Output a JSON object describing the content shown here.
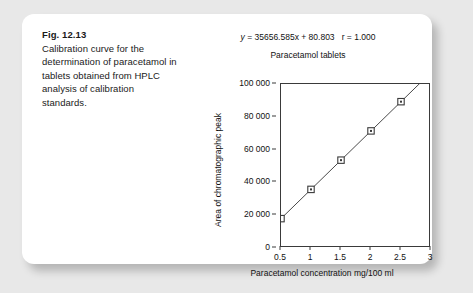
{
  "card": {
    "background_color": "#ffffff",
    "page_background_color": "#e8e8e8"
  },
  "caption": {
    "figure_number": "Fig. 12.13",
    "text": "Calibration curve for the determination of paracetamol in tablets obtained from HPLC analysis of calibration standards."
  },
  "figure": {
    "equation_y": "y",
    "equation_rest": " = 35656.585x + 80.803   r = 1.000",
    "equation_full": "y = 35656.585x + 80.803   r = 1.000",
    "slope": 35656.585,
    "intercept": 80.803,
    "correlation_r": 1.0
  },
  "chart_data": {
    "type": "scatter",
    "title": "Paracetamol tablets",
    "xlabel": "Paracetamol concentration mg/100 ml",
    "ylabel": "Area of chromatographic peak",
    "x": [
      0.5,
      1,
      1.5,
      2,
      2.5
    ],
    "values": [
      17909,
      35737,
      53566,
      71394,
      89222
    ],
    "series": [
      {
        "name": "Calibration standards",
        "x": [
          0.5,
          1,
          1.5,
          2,
          2.5
        ],
        "values": [
          17909,
          35737,
          53566,
          71394,
          89222
        ]
      }
    ],
    "trendline": {
      "type": "line",
      "slope": 35656.585,
      "intercept": 80.803,
      "x_start": 0.5,
      "x_end": 3.0
    },
    "xlim": [
      0.5,
      3
    ],
    "ylim": [
      0,
      100000
    ],
    "xticks": [
      0.5,
      1,
      1.5,
      2,
      2.5,
      3
    ],
    "xtick_labels": [
      "0.5",
      "1",
      "1.5",
      "2",
      "2.5",
      "3"
    ],
    "yticks": [
      0,
      20000,
      40000,
      60000,
      80000,
      100000
    ],
    "ytick_labels": [
      "0",
      "20 000",
      "40 000",
      "60 000",
      "80 000",
      "100 000"
    ],
    "grid": false,
    "legend": "none",
    "marker": "square",
    "line_color": "#4a4a4a",
    "marker_color": "#3a3a3a"
  }
}
